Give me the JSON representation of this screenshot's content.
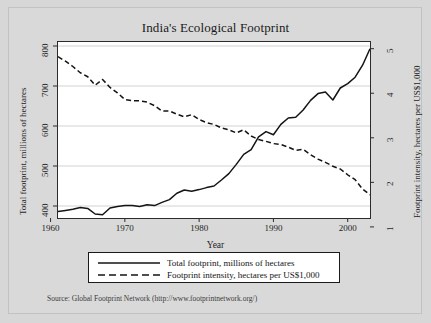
{
  "figure": {
    "title": "India's Ecological Footprint",
    "source_note": "Source: Global Footprint Network (http://www.footprintnetwork.org/)"
  },
  "legend": {
    "items": [
      {
        "key": "solid-line",
        "label": "Total footprint, millions of hectares"
      },
      {
        "key": "dashed-line",
        "label": "Footprint intensity, hectares per US$1,000"
      }
    ]
  },
  "chart_data": {
    "type": "line",
    "title": "India's Ecological Footprint",
    "xlabel": "Year",
    "ylabel": "Total footprint, millions of hectares",
    "ylabel_right": "Footprint intensity, hectares per US$1,000",
    "xlim": [
      1961,
      2003
    ],
    "ylim": [
      370,
      810
    ],
    "ylim_right": [
      1.2,
      5.15
    ],
    "xticks": [
      1960,
      1970,
      1980,
      1990,
      2000
    ],
    "yticks": [
      400,
      500,
      600,
      700,
      800
    ],
    "yticks_right": [
      1,
      2,
      3,
      4,
      5
    ],
    "grid": "horizontal",
    "legend_position": "below-axes",
    "x": [
      1961,
      1962,
      1963,
      1964,
      1965,
      1966,
      1967,
      1968,
      1969,
      1970,
      1971,
      1972,
      1973,
      1974,
      1975,
      1976,
      1977,
      1978,
      1979,
      1980,
      1981,
      1982,
      1983,
      1984,
      1985,
      1986,
      1987,
      1988,
      1989,
      1990,
      1991,
      1992,
      1993,
      1994,
      1995,
      1996,
      1997,
      1998,
      1999,
      2000,
      2001,
      2002,
      2003
    ],
    "series": [
      {
        "name": "Total footprint, millions of hectares",
        "axis": "left",
        "style": "solid",
        "color": "#141414",
        "values": [
          386,
          389,
          392,
          396,
          394,
          380,
          378,
          395,
          399,
          401,
          401,
          399,
          403,
          401,
          409,
          416,
          432,
          440,
          437,
          441,
          446,
          450,
          465,
          481,
          504,
          529,
          541,
          573,
          586,
          578,
          604,
          620,
          622,
          640,
          664,
          681,
          685,
          665,
          695,
          706,
          722,
          752,
          793
        ]
      },
      {
        "name": "Footprint intensity, hectares per US$1,000",
        "axis": "right",
        "style": "dashed",
        "color": "#141414",
        "values": [
          4.82,
          4.72,
          4.6,
          4.46,
          4.37,
          4.18,
          4.31,
          4.13,
          4.01,
          3.86,
          3.83,
          3.83,
          3.8,
          3.72,
          3.6,
          3.6,
          3.53,
          3.47,
          3.52,
          3.41,
          3.34,
          3.3,
          3.22,
          3.18,
          3.11,
          3.18,
          3.04,
          2.96,
          2.92,
          2.87,
          2.85,
          2.79,
          2.72,
          2.74,
          2.62,
          2.52,
          2.45,
          2.36,
          2.3,
          2.17,
          2.06,
          1.85,
          1.72
        ]
      }
    ]
  }
}
